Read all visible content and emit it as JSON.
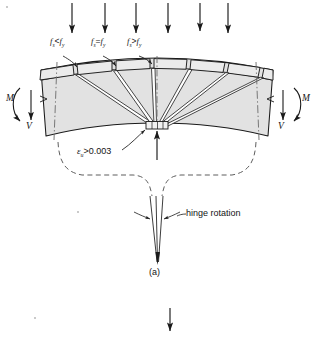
{
  "figure": {
    "caption": "(a)",
    "background_color": "#ffffff",
    "line_color": "#1a1a1a",
    "concrete_fill": "#e2e2e2",
    "segment_fill": "#ebebeb"
  },
  "labels": {
    "stress_left": {
      "symbol": "f",
      "sub1": "s",
      "relation": "<",
      "symbol2": "f",
      "sub2": "y",
      "text": "fs<fy"
    },
    "stress_center": {
      "symbol": "f",
      "sub1": "s",
      "relation": "=",
      "symbol2": "f",
      "sub2": "y",
      "text": "fs=fy"
    },
    "stress_right": {
      "symbol": "f",
      "sub1": "s",
      "relation": ">",
      "symbol2": "f",
      "sub2": "y",
      "text": "fs>fy"
    },
    "strain": {
      "symbol": "ε",
      "sub": "u",
      "relation": ">",
      "value": "0.003",
      "text": "εu>0.003"
    },
    "hinge_rotation": "hinge rotation",
    "moment_left": "M",
    "moment_right": "M",
    "shear_left": "V",
    "shear_right": "V",
    "caption": "(a)"
  },
  "loads": {
    "count": 6,
    "arrow_direction": "down",
    "x_positions": [
      72,
      105,
      136,
      168,
      200,
      228
    ],
    "y_top": 3,
    "y_bottom": 36
  },
  "reaction": {
    "direction": "up",
    "label": "",
    "x": 157
  },
  "bottom_arrow": {
    "direction": "down",
    "x": 170,
    "y_top": 308,
    "y_bottom": 332
  },
  "segments": {
    "count": 7,
    "description": "top flange blocks separated by flexural cracks"
  },
  "cracks": {
    "count": 6,
    "description": "wedge-shaped flexural cracks fanning from top segments to compression zone"
  },
  "crush_zone": {
    "description": "crushed concrete at compression face",
    "hatch_count": 3
  }
}
